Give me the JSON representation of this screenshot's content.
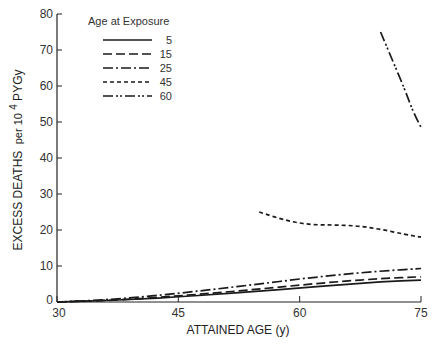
{
  "chart_data": {
    "type": "line",
    "title": "",
    "xlabel": "ATTAINED AGE (y)",
    "ylabel_main": "EXCESS DEATHS",
    "ylabel_sub": "per 10",
    "ylabel_sup": "4",
    "ylabel_tail": "PYGy",
    "xlim": [
      30,
      75
    ],
    "ylim": [
      0,
      80
    ],
    "xticks": [
      30,
      45,
      60,
      75
    ],
    "yticks": [
      0,
      10,
      20,
      30,
      40,
      50,
      60,
      70,
      80
    ],
    "grid": false,
    "legend": {
      "title": "Age at Exposure",
      "position": "upper-left",
      "entries": [
        "5",
        "15",
        "25",
        "45",
        "60"
      ]
    },
    "series": [
      {
        "name": "5",
        "style": "solid",
        "x": [
          30,
          35,
          40,
          45,
          50,
          55,
          60,
          65,
          70,
          75
        ],
        "y": [
          0,
          0.3,
          0.8,
          1.4,
          2.2,
          3.0,
          3.9,
          4.8,
          5.6,
          6.1
        ]
      },
      {
        "name": "15",
        "style": "dashed",
        "x": [
          30,
          35,
          40,
          45,
          50,
          55,
          60,
          65,
          70,
          75
        ],
        "y": [
          0,
          0.3,
          0.9,
          1.7,
          2.6,
          3.6,
          4.7,
          5.7,
          6.5,
          7.0
        ]
      },
      {
        "name": "25",
        "style": "dash-dot",
        "x": [
          30,
          35,
          40,
          45,
          50,
          55,
          60,
          65,
          70,
          75
        ],
        "y": [
          0,
          0.5,
          1.3,
          2.4,
          3.7,
          5.0,
          6.4,
          7.6,
          8.6,
          9.3
        ]
      },
      {
        "name": "45",
        "style": "short-dash",
        "x": [
          55,
          58,
          61,
          64,
          67,
          70,
          73,
          75
        ],
        "y": [
          25,
          22.8,
          21.5,
          21.4,
          21.2,
          20.2,
          18.8,
          18
        ]
      },
      {
        "name": "60",
        "style": "dash-dot-dot",
        "x": [
          70,
          71.5,
          73,
          74,
          75
        ],
        "y": [
          75,
          67,
          59,
          53,
          48.5
        ]
      }
    ]
  }
}
